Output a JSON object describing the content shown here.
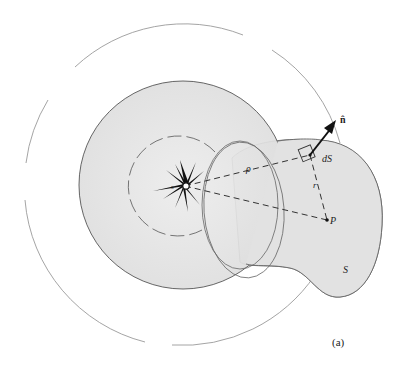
{
  "figure": {
    "panel_label": "(a)",
    "labels": {
      "normal": "n̂",
      "area_element": "dS",
      "rho": "ρ",
      "r": "r",
      "point": "P",
      "surface": "S",
      "source_s": "s",
      "source_c": "c"
    },
    "colors": {
      "background": "#ffffff",
      "shaded_region": "#e6e6e6",
      "outline": "#555555",
      "dashed_line": "#333333",
      "source": "#111111",
      "outer_arcs": "#9a9a9a"
    }
  }
}
